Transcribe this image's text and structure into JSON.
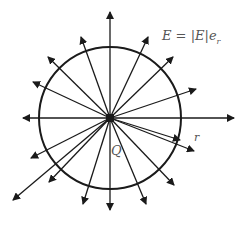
{
  "diagram": {
    "center": [
      110,
      118
    ],
    "circle_radius": 71,
    "stroke_color": "#1a1a1a",
    "label_color": "#555555",
    "labels": {
      "field_equation": "E = |E|e",
      "field_equation_subscript": "r",
      "radius": "r",
      "charge": "Q"
    },
    "arrows": [
      {
        "to": [
          110,
          12
        ]
      },
      {
        "to": [
          234,
          118
        ]
      },
      {
        "to": [
          23,
          118
        ]
      },
      {
        "to": [
          110,
          210
        ]
      },
      {
        "to": [
          148,
          37
        ]
      },
      {
        "to": [
          173,
          57
        ]
      },
      {
        "to": [
          196,
          89
        ]
      },
      {
        "to": [
          81,
          37
        ]
      },
      {
        "to": [
          48,
          57
        ]
      },
      {
        "to": [
          33,
          82
        ]
      },
      {
        "to": [
          180,
          140
        ]
      },
      {
        "to": [
          194,
          151
        ]
      },
      {
        "to": [
          174,
          185
        ]
      },
      {
        "to": [
          146,
          204
        ]
      },
      {
        "to": [
          83,
          204
        ]
      },
      {
        "to": [
          49,
          182
        ]
      },
      {
        "to": [
          31,
          158
        ]
      },
      {
        "to": [
          13,
          200
        ]
      }
    ]
  }
}
